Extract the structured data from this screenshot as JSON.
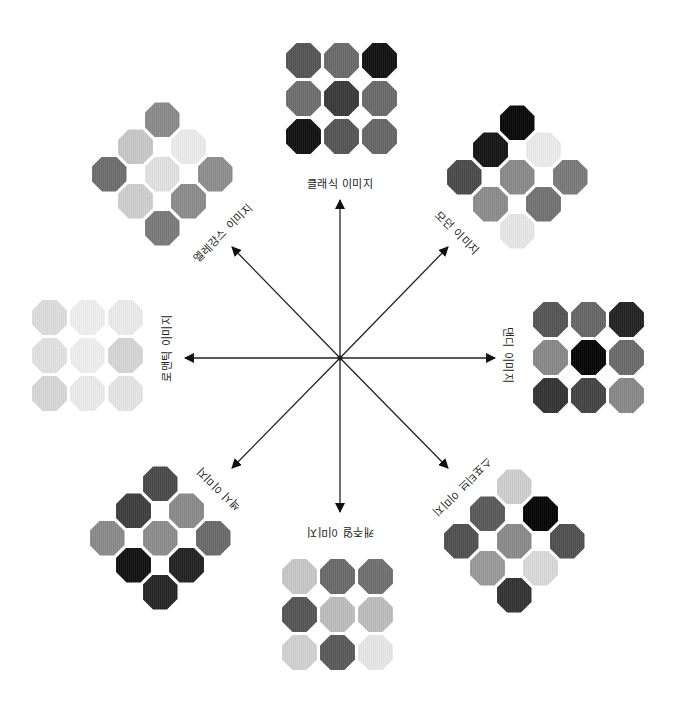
{
  "diagram": {
    "center": [
      340,
      358
    ],
    "arrows": [
      {
        "name": "classic",
        "tip": [
          340,
          200
        ]
      },
      {
        "name": "modern",
        "tip": [
          448,
          247
        ]
      },
      {
        "name": "dandy",
        "tip": [
          495,
          358
        ]
      },
      {
        "name": "sportive",
        "tip": [
          448,
          468
        ]
      },
      {
        "name": "casual",
        "tip": [
          340,
          512
        ]
      },
      {
        "name": "sexy",
        "tip": [
          232,
          468
        ]
      },
      {
        "name": "romantic",
        "tip": [
          185,
          358
        ]
      },
      {
        "name": "elegance",
        "tip": [
          232,
          247
        ]
      }
    ],
    "labels": {
      "classic": "클래식 이미지",
      "modern": "모던 이미지",
      "dandy": "댄디 이미지",
      "sportive": "스포티브 이미지",
      "casual": "캐주얼 이미지",
      "sexy": "섹시 이미지",
      "romantic": "로맨틱 이미지",
      "elegance": "엘레강스 이미지"
    },
    "label_positions": {
      "classic": {
        "x": 340,
        "y": 183,
        "rot": 0
      },
      "modern": {
        "x": 458,
        "y": 232,
        "rot": 45
      },
      "dandy": {
        "x": 509,
        "y": 355,
        "rot": 90
      },
      "sportive": {
        "x": 463,
        "y": 488,
        "rot": 135
      },
      "casual": {
        "x": 340,
        "y": 533,
        "rot": 180
      },
      "sexy": {
        "x": 218,
        "y": 490,
        "rot": -135
      },
      "romantic": {
        "x": 166,
        "y": 348,
        "rot": -90
      },
      "elegance": {
        "x": 222,
        "y": 232,
        "rot": -45
      }
    },
    "swatch_groups": [
      {
        "name": "classic",
        "layout": "grid",
        "origin": [
          286,
          43
        ],
        "colors": [
          "#555555",
          "#6a6a6a",
          "#111111",
          "#6e6e6e",
          "#3a3a3a",
          "#6a6a6a",
          "#111111",
          "#555555",
          "#666666"
        ]
      },
      {
        "name": "dandy",
        "layout": "grid",
        "origin": [
          533,
          302
        ],
        "colors": [
          "#555555",
          "#666666",
          "#222222",
          "#888888",
          "#050505",
          "#6a6a6a",
          "#333333",
          "#444444",
          "#888888"
        ]
      },
      {
        "name": "romantic",
        "layout": "grid",
        "origin": [
          32,
          300
        ],
        "colors": [
          "#dddddd",
          "#f0f0f0",
          "#ececec",
          "#e2e2e2",
          "#f0f0f0",
          "#d6d6d6",
          "#d8d8d8",
          "#ececec",
          "#e6e6e6"
        ]
      },
      {
        "name": "casual",
        "layout": "grid",
        "origin": [
          282,
          559
        ],
        "colors": [
          "#c8c8c8",
          "#6a6a6a",
          "#707070",
          "#555555",
          "#bdbdbd",
          "#bdbdbd",
          "#d2d2d2",
          "#5a5a5a",
          "#e8e8e8"
        ]
      },
      {
        "name": "elegance",
        "layout": "diamond",
        "center": [
          162,
          174
        ],
        "colors": [
          "#8a8a8a",
          "#c8c8c8",
          "#ececec",
          "#6e6e6e",
          "#e2e2e2",
          "#8e8e8e",
          "#cfcfcf",
          "#8c8c8c",
          "#7a7a7a"
        ]
      },
      {
        "name": "modern",
        "layout": "diamond",
        "center": [
          517,
          177
        ],
        "colors": [
          "#080808",
          "#151515",
          "#ececec",
          "#4a4a4a",
          "#8a8a8a",
          "#7a7a7a",
          "#8c8c8c",
          "#727272",
          "#e8e8e8"
        ]
      },
      {
        "name": "sportive",
        "layout": "diamond",
        "center": [
          514,
          541
        ],
        "colors": [
          "#cfcfcf",
          "#5a5a5a",
          "#050505",
          "#505050",
          "#8a8a8a",
          "#505050",
          "#9a9a9a",
          "#dadada",
          "#333333"
        ]
      },
      {
        "name": "sexy",
        "layout": "diamond",
        "center": [
          160,
          538
        ],
        "colors": [
          "#4a4a4a",
          "#3e3e3e",
          "#8a8a8a",
          "#8a8a8a",
          "#8c8c8c",
          "#6a6a6a",
          "#111111",
          "#222222",
          "#252525"
        ]
      }
    ]
  }
}
